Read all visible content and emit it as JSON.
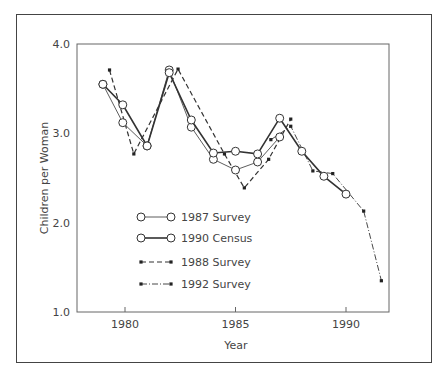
{
  "chart_data": {
    "type": "line",
    "title": "",
    "xlabel": "Year",
    "ylabel": "Children per Woman",
    "xlim": [
      1978.5,
      1992.0
    ],
    "ylim": [
      1.0,
      4.0
    ],
    "x_ticks": [
      1980,
      1985,
      1990
    ],
    "x_tick_labels": [
      "1980",
      "1985",
      "1990"
    ],
    "y_ticks": [
      1.0,
      2.0,
      3.0,
      4.0
    ],
    "y_tick_labels": [
      "1.0",
      "2.0",
      "3.0",
      "4.0"
    ],
    "grid": false,
    "legend_position": "lower-left inside plot",
    "series": [
      {
        "name": "1987 Survey",
        "style": "thin-solid-open-circle",
        "x": [
          1979.0,
          1979.9,
          1981.0,
          1982.0,
          1983.0,
          1984.0,
          1985.0,
          1986.0,
          1987.0
        ],
        "values": [
          3.55,
          3.12,
          2.86,
          3.71,
          3.07,
          2.71,
          2.59,
          2.68,
          2.96
        ]
      },
      {
        "name": "1990 Census",
        "style": "thick-solid-open-circle",
        "x": [
          1979.0,
          1979.9,
          1981.0,
          1982.0,
          1983.0,
          1984.0,
          1985.0,
          1986.0,
          1987.0,
          1988.0,
          1989.0,
          1990.0
        ],
        "values": [
          3.55,
          3.32,
          2.86,
          3.68,
          3.15,
          2.78,
          2.8,
          2.77,
          3.17,
          2.8,
          2.52,
          2.32
        ]
      },
      {
        "name": "1988 Survey",
        "style": "dashed-filled-dot",
        "x": [
          1979.3,
          1980.4,
          1982.4,
          1984.5,
          1985.4,
          1986.5,
          1987.5
        ],
        "values": [
          3.71,
          2.77,
          3.72,
          2.77,
          2.39,
          2.71,
          3.16
        ]
      },
      {
        "name": "1992 Survey",
        "style": "dash-dot-filled-dot",
        "x": [
          1986.6,
          1987.5,
          1988.5,
          1989.4,
          1990.8,
          1991.6
        ],
        "values": [
          2.93,
          3.08,
          2.58,
          2.55,
          2.13,
          1.35
        ]
      }
    ]
  }
}
